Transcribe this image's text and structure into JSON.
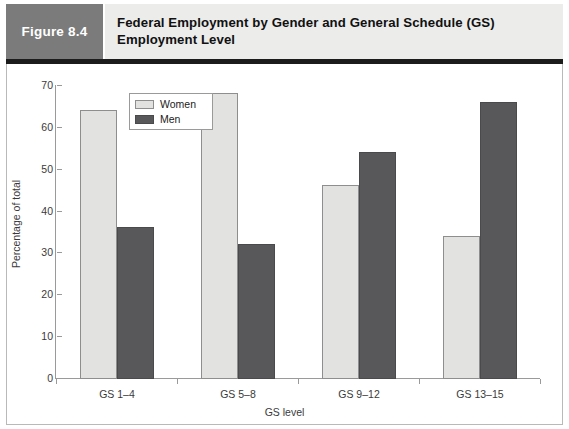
{
  "figure": {
    "tab_label": "Figure 8.4",
    "title": "Federal Employment by Gender and General Schedule (GS) Employment Level"
  },
  "colors": {
    "tab_background": "#7b7b7b",
    "header_background": "#ececeb",
    "rule": "#1c1c1c",
    "women_fill": "#e2e2e1",
    "men_fill": "#58585a",
    "axis": "#9a9a9a",
    "frame_border": "#b9b9b9"
  },
  "chart_data": {
    "type": "bar",
    "title": "Federal Employment by Gender and General Schedule (GS) Employment Level",
    "xlabel": "GS level",
    "ylabel": "Percentage of total",
    "categories": [
      "GS 1–4",
      "GS 5–8",
      "GS 9–12",
      "GS 13–15"
    ],
    "series": [
      {
        "name": "Women",
        "values": [
          64,
          68,
          46,
          34
        ],
        "color": "#e2e2e1"
      },
      {
        "name": "Men",
        "values": [
          36,
          32,
          54,
          66
        ],
        "color": "#58585a"
      }
    ],
    "ylim": [
      0,
      70
    ],
    "yticks": [
      0,
      10,
      20,
      30,
      40,
      50,
      60,
      70
    ],
    "ytick_labels": [
      "0",
      "10",
      "20",
      "30",
      "40",
      "50",
      "60",
      "70"
    ],
    "grid": false,
    "legend_position": "upper-left-inside",
    "legend_entries": [
      "Women",
      "Men"
    ]
  }
}
